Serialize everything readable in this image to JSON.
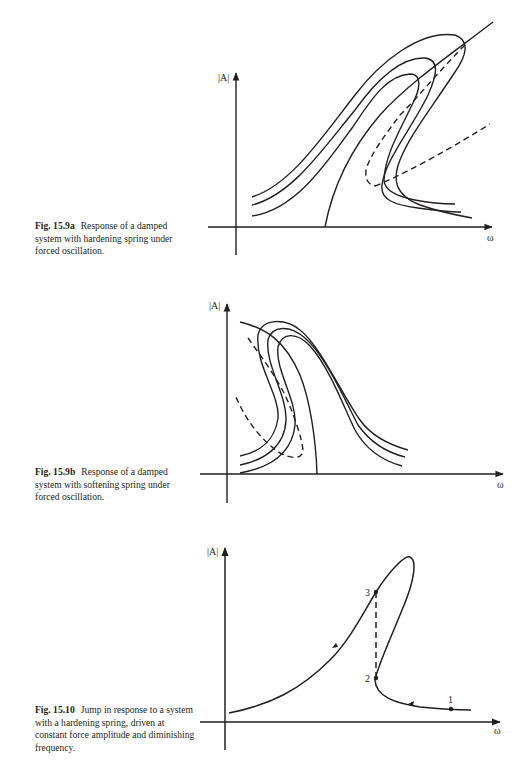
{
  "figures": [
    {
      "id": "fig-15-9a",
      "number": "Fig. 15.9a",
      "caption": "Response of a damped system with hardening spring under forced oscillation.",
      "y_axis_label": "|A|",
      "x_axis_label": "ω"
    },
    {
      "id": "fig-15-9b",
      "number": "Fig. 15.9b",
      "caption": "Response of a damped system with softening spring under forced oscillation.",
      "y_axis_label": "|A|",
      "x_axis_label": "ω"
    },
    {
      "id": "fig-15-10",
      "number": "Fig. 15.10",
      "caption": "Jump in response to a system with a hardening spring, driven at constant force amplitude and diminishing frequency.",
      "y_axis_label": "|A|",
      "x_axis_label": "ω",
      "points": [
        "1",
        "2",
        "3"
      ]
    }
  ],
  "colors": {
    "ink": "#231f20",
    "background": "#ffffff"
  }
}
